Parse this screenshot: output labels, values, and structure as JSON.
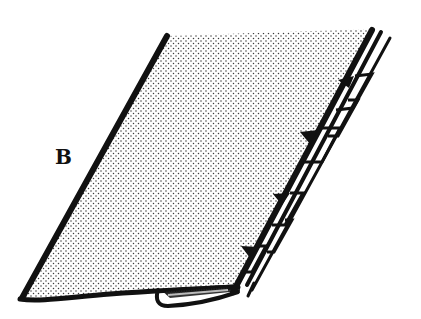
{
  "figure": {
    "labels": [
      {
        "text": "B",
        "x": 55,
        "y": 147
      }
    ],
    "colors": {
      "ink": "#111111",
      "background": "#ffffff",
      "stipple": "#3a3a3a"
    },
    "parts": [
      "fabric-panel",
      "left-edge",
      "stitched-spine",
      "zigzag-stitches",
      "folded-hem"
    ]
  }
}
